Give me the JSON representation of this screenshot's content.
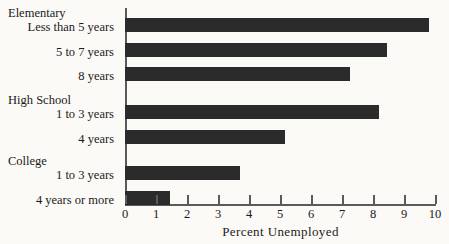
{
  "chart_data": {
    "type": "bar",
    "orientation": "horizontal",
    "title": "",
    "xlabel": "Percent  Unemployed",
    "ylabel": "",
    "xlim": [
      0,
      10
    ],
    "xticks": [
      0,
      1,
      2,
      3,
      4,
      5,
      6,
      7,
      8,
      9,
      10
    ],
    "xticklabels": [
      "0",
      "1",
      "2",
      "3",
      "4",
      "5",
      "6",
      "7",
      "8",
      "9",
      "10"
    ],
    "grid": false,
    "legend": false,
    "bar_color": "#2b2b2b",
    "axis_color": "#5a5a5a",
    "background": "#fbfaf7",
    "groups": [
      {
        "name": "Elementary",
        "categories": [
          "Less than 5 years",
          "5  to  7  years",
          "8  years"
        ]
      },
      {
        "name": "High School",
        "categories": [
          "1  to  3  years",
          "4  years"
        ]
      },
      {
        "name": "College",
        "categories": [
          "1  to  3  years",
          "4 years or more"
        ]
      }
    ],
    "categories": [
      "Less than 5 years",
      "5  to  7  years",
      "8  years",
      "1  to  3  years",
      "4  years",
      "1  to  3  years",
      "4 years or more"
    ],
    "values": [
      9.8,
      8.45,
      7.25,
      8.2,
      5.15,
      3.7,
      1.45
    ]
  },
  "labels": {
    "group_elementary": "Elementary",
    "cat_less_than_5": "Less than 5 years",
    "cat_5_to_7": "5  to  7  years",
    "cat_8_years": "8  years",
    "group_high_school": "High  School",
    "cat_hs_1_to_3": "1  to  3  years",
    "cat_hs_4": "4  years",
    "group_college": "College",
    "cat_col_1_to_3": "1  to  3  years",
    "cat_col_4_or_more": "4 years or more"
  }
}
